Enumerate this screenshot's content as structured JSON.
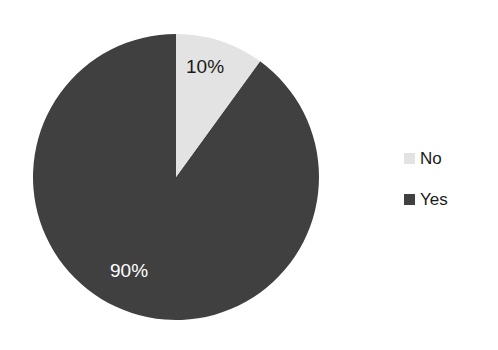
{
  "chart_data": {
    "type": "pie",
    "title": "",
    "categories": [
      "No",
      "Yes"
    ],
    "values": [
      10,
      90
    ],
    "labels": [
      "10%",
      "90%"
    ],
    "colors": [
      "#e3e3e3",
      "#404040"
    ],
    "legend_position": "right",
    "grid": false,
    "start_angle_deg": 0,
    "direction": "clockwise",
    "xlabel": "",
    "ylabel": "",
    "slices": [
      {
        "name": "No",
        "value": 10,
        "label": "10%",
        "color": "#e3e3e3",
        "label_color": "#1a1a1a"
      },
      {
        "name": "Yes",
        "value": 90,
        "label": "90%",
        "color": "#404040",
        "label_color": "#ffffff"
      }
    ]
  },
  "legend": {
    "items": [
      {
        "label": "No",
        "color": "#e3e3e3"
      },
      {
        "label": "Yes",
        "color": "#404040"
      }
    ]
  },
  "canvas": {
    "background": "#ffffff"
  }
}
